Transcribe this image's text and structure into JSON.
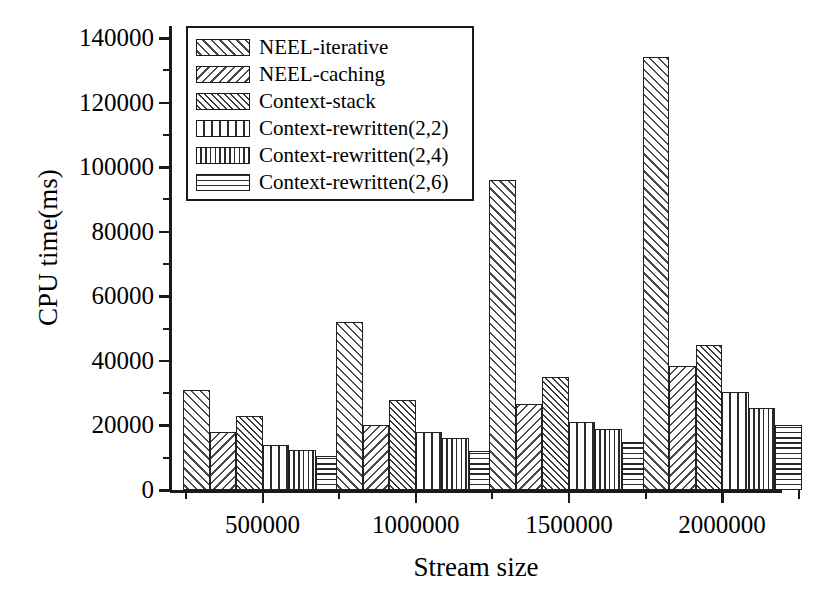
{
  "chart_data": {
    "type": "bar",
    "title": "",
    "xlabel": "Stream size",
    "ylabel": "CPU time(ms)",
    "categories": [
      "500000",
      "1000000",
      "1500000",
      "2000000"
    ],
    "ylim": [
      0,
      145000
    ],
    "yticks": [
      0,
      20000,
      40000,
      60000,
      80000,
      100000,
      120000,
      140000
    ],
    "ytick_labels": [
      "0",
      "20000",
      "40000",
      "60000",
      "80000",
      "100000",
      "120000",
      "140000"
    ],
    "minor_tick_step": 10000,
    "grid": false,
    "legend_position": "upper-left-inside",
    "series": [
      {
        "name": "NEEL-iterative",
        "pattern": "diagonal-up-hatch",
        "values": [
          31000,
          52000,
          96000,
          134000
        ]
      },
      {
        "name": "NEEL-caching",
        "pattern": "diagonal-down-hatch",
        "values": [
          18000,
          20000,
          26500,
          38500
        ]
      },
      {
        "name": "Context-stack",
        "pattern": "cross-hatch-dots",
        "values": [
          23000,
          28000,
          35000,
          45000
        ]
      },
      {
        "name": "Context-rewritten(2,2)",
        "pattern": "grid",
        "values": [
          14000,
          18000,
          21000,
          30500
        ]
      },
      {
        "name": "Context-rewritten(2,4)",
        "pattern": "vertical-lines",
        "values": [
          12500,
          16000,
          19000,
          25500
        ]
      },
      {
        "name": "Context-rewritten(2,6)",
        "pattern": "horizontal-lines",
        "values": [
          10500,
          12000,
          15000,
          20000
        ]
      }
    ]
  },
  "axes": {
    "ylabel": "CPU time(ms)",
    "xlabel": "Stream size"
  },
  "legend": {
    "entries": [
      "NEEL-iterative",
      "NEEL-caching",
      "Context-stack",
      "Context-rewritten(2,2)",
      "Context-rewritten(2,4)",
      "Context-rewritten(2,6)"
    ]
  },
  "colors": {
    "ink": "#1a1a1a",
    "background": "#ffffff",
    "hatch": "#3a3a3a"
  }
}
